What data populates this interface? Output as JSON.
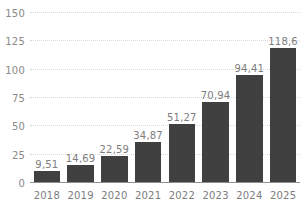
{
  "chart_data": {
    "type": "bar",
    "title": "",
    "subtitle": "",
    "xlabel": "",
    "ylabel": "",
    "categories": [
      "2018",
      "2019",
      "2020",
      "2021",
      "2022",
      "2023",
      "2024",
      "2025"
    ],
    "values": [
      9.51,
      14.69,
      22.59,
      34.87,
      51.27,
      70.94,
      94.41,
      118.6
    ],
    "value_labels": [
      "9,51",
      "14,69",
      "22,59",
      "34,87",
      "51,27",
      "70,94",
      "94,41",
      "118,6"
    ],
    "ylim": [
      0,
      150
    ],
    "yticks": [
      0,
      25,
      50,
      75,
      100,
      125,
      150
    ],
    "ytick_labels": [
      "0",
      "25",
      "50",
      "75",
      "100",
      "125",
      "150"
    ],
    "grid": true,
    "grid_axis": "y",
    "legend": false,
    "legend_position": "none",
    "series": [
      {
        "name": "",
        "values": [
          9.51,
          14.69,
          22.59,
          34.87,
          51.27,
          70.94,
          94.41,
          118.6
        ]
      }
    ]
  },
  "style": {
    "bar_color": "#404040",
    "background_color": "#ffffff",
    "grid_color": "#d8d8d8",
    "axis_color": "#8f8f8f",
    "tick_label_color": "#8a8a8a",
    "value_label_color": "#7d7d7d"
  }
}
